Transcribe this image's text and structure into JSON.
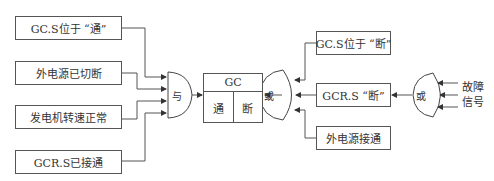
{
  "diagram": {
    "left_inputs": [
      {
        "label": "GC.S位于 “通”"
      },
      {
        "label": "外电源已切断"
      },
      {
        "label": "发电机转速正常"
      },
      {
        "label": "GCR.S已接通"
      }
    ],
    "and_gate": {
      "label": "与"
    },
    "gc_block": {
      "title": "GC",
      "on": "通",
      "off": "断"
    },
    "or_gate_mid": {
      "label": "或"
    },
    "right_inputs": [
      {
        "label": "GC.S位于 “断”"
      },
      {
        "label": "GCR.S “断”"
      },
      {
        "label": "外电源接通"
      }
    ],
    "or_gate_right": {
      "label": "或"
    },
    "fault_signal": {
      "line1": "故障",
      "line2": "信号"
    }
  }
}
